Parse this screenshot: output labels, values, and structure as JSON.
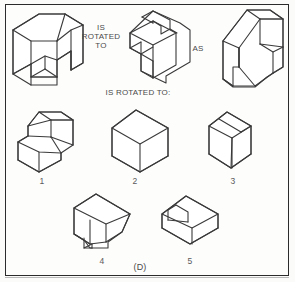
{
  "page": {
    "answer_key": "(D)",
    "background_color": "#fbfbfa",
    "line_color": "#3a3a3a",
    "text_color": "#4a4a4a"
  },
  "prompt": {
    "connector_1": "IS\nROTATED\nTO",
    "connector_2": "AS",
    "connector_3": "IS ROTATED TO:"
  },
  "stimuli": [
    {
      "id": "stimulus-a",
      "name": "L-shaped stepped block with vertical slab",
      "description": "Isometric open block with notched step at lower front and tall slab on right"
    },
    {
      "id": "stimulus-b",
      "name": "Cube with rectangular channel and lower step",
      "description": "Isometric cube with a notched groove cut into the top face and an L step at front left"
    },
    {
      "id": "stimulus-c",
      "name": "Angled wedge stack",
      "description": "Isometric two-tier angled block with sloped ramps"
    }
  ],
  "options": [
    {
      "id": "option-1",
      "label": "1",
      "name": "stepped-hexagonal-block"
    },
    {
      "id": "option-2",
      "label": "2",
      "name": "plain-cube"
    },
    {
      "id": "option-3",
      "label": "3",
      "name": "flat-slab-with-top-notch"
    },
    {
      "id": "option-4",
      "label": "4",
      "name": "cube-with-bevel-and-notch"
    },
    {
      "id": "option-5",
      "label": "5",
      "name": "cube-with-triangular-notch"
    }
  ],
  "answer": {
    "label": "(D)"
  }
}
